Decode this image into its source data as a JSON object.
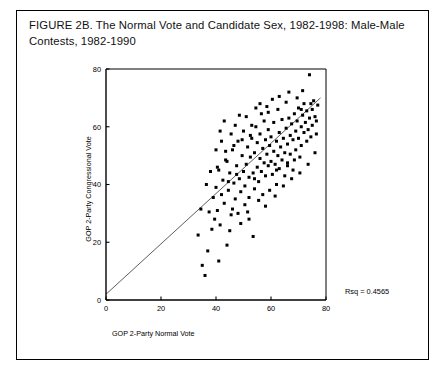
{
  "figure": {
    "title": "FIGURE 2B. The Normal Vote and Candidate Sex, 1982-1998: Male-Male Contests, 1982-1990"
  },
  "annotations": {
    "rsq_label": "Rsq = 0.4565"
  },
  "axis": {
    "x_title": "GOP 2-Party Normal Vote",
    "y_title": "GOP 2-Party Congressional Vote",
    "x_ticks": [
      "0",
      "20",
      "40",
      "60",
      "80"
    ],
    "y_ticks": [
      "0",
      "20",
      "40",
      "60",
      "80"
    ]
  },
  "chart_data": {
    "type": "scatter",
    "title": "FIGURE 2B. The Normal Vote and Candidate Sex, 1982-1998: Male-Male Contests, 1982-1990",
    "xlabel": "GOP 2-Party Normal Vote",
    "ylabel": "GOP 2-Party Congressional Vote",
    "xlim": [
      0,
      80
    ],
    "ylim": [
      0,
      80
    ],
    "xticks": [
      0,
      20,
      40,
      60,
      80
    ],
    "yticks": [
      0,
      20,
      40,
      60,
      80
    ],
    "grid": false,
    "legend": null,
    "marker": "square",
    "marker_color": "#000000",
    "r_squared": 0.4565,
    "annotations": [
      {
        "text": "Rsq = 0.4565",
        "x": 66,
        "y": 7
      }
    ],
    "fit_line": {
      "type": "linear-regression",
      "x0": 0,
      "y0": 2.0,
      "x1": 78,
      "y1": 70.0,
      "color": "#555555"
    },
    "points": [
      [
        33.5,
        22.5
      ],
      [
        35.0,
        12.0
      ],
      [
        36.0,
        8.5
      ],
      [
        37.5,
        30.5
      ],
      [
        38.5,
        24.5
      ],
      [
        39.0,
        35.5
      ],
      [
        40.0,
        39.0
      ],
      [
        40.5,
        31.0
      ],
      [
        41.0,
        45.0
      ],
      [
        41.5,
        26.0
      ],
      [
        42.0,
        36.5
      ],
      [
        42.5,
        41.5
      ],
      [
        43.0,
        33.5
      ],
      [
        43.5,
        48.5
      ],
      [
        44.0,
        19.0
      ],
      [
        44.5,
        38.0
      ],
      [
        45.0,
        44.0
      ],
      [
        45.5,
        29.5
      ],
      [
        46.0,
        52.0
      ],
      [
        46.5,
        40.5
      ],
      [
        47.0,
        35.0
      ],
      [
        47.5,
        46.5
      ],
      [
        48.0,
        55.0
      ],
      [
        48.5,
        42.0
      ],
      [
        49.0,
        37.5
      ],
      [
        49.5,
        50.0
      ],
      [
        50.0,
        44.5
      ],
      [
        50.0,
        58.5
      ],
      [
        50.5,
        39.5
      ],
      [
        51.0,
        47.0
      ],
      [
        51.5,
        53.0
      ],
      [
        52.0,
        42.5
      ],
      [
        52.0,
        35.5
      ],
      [
        52.5,
        49.5
      ],
      [
        53.0,
        56.0
      ],
      [
        53.5,
        44.0
      ],
      [
        54.0,
        51.0
      ],
      [
        54.0,
        38.5
      ],
      [
        54.5,
        60.0
      ],
      [
        55.0,
        46.0
      ],
      [
        55.0,
        54.5
      ],
      [
        55.5,
        41.0
      ],
      [
        56.0,
        49.0
      ],
      [
        56.0,
        57.5
      ],
      [
        56.5,
        44.5
      ],
      [
        57.0,
        52.5
      ],
      [
        57.0,
        36.5
      ],
      [
        57.5,
        47.5
      ],
      [
        58.0,
        55.5
      ],
      [
        58.0,
        43.0
      ],
      [
        58.5,
        50.5
      ],
      [
        59.0,
        59.0
      ],
      [
        59.0,
        46.5
      ],
      [
        59.5,
        53.5
      ],
      [
        60.0,
        48.0
      ],
      [
        60.0,
        56.5
      ],
      [
        60.5,
        43.5
      ],
      [
        61.0,
        51.5
      ],
      [
        61.0,
        61.5
      ],
      [
        61.5,
        47.0
      ],
      [
        62.0,
        55.0
      ],
      [
        62.0,
        40.0
      ],
      [
        62.5,
        50.0
      ],
      [
        63.0,
        58.0
      ],
      [
        63.0,
        45.5
      ],
      [
        63.5,
        53.0
      ],
      [
        64.0,
        48.5
      ],
      [
        64.0,
        62.5
      ],
      [
        64.5,
        56.0
      ],
      [
        65.0,
        51.0
      ],
      [
        65.0,
        43.0
      ],
      [
        65.5,
        59.5
      ],
      [
        66.0,
        54.0
      ],
      [
        66.0,
        47.5
      ],
      [
        66.5,
        63.0
      ],
      [
        67.0,
        57.0
      ],
      [
        67.0,
        50.5
      ],
      [
        67.5,
        61.0
      ],
      [
        68.0,
        55.5
      ],
      [
        68.0,
        45.0
      ],
      [
        68.5,
        64.5
      ],
      [
        69.0,
        58.5
      ],
      [
        69.0,
        52.0
      ],
      [
        69.5,
        62.0
      ],
      [
        70.0,
        56.0
      ],
      [
        70.0,
        66.5
      ],
      [
        70.5,
        49.5
      ],
      [
        71.0,
        60.0
      ],
      [
        71.0,
        53.5
      ],
      [
        71.5,
        64.0
      ],
      [
        72.0,
        58.0
      ],
      [
        72.0,
        68.0
      ],
      [
        72.5,
        61.5
      ],
      [
        73.0,
        55.0
      ],
      [
        73.0,
        65.5
      ],
      [
        73.5,
        59.0
      ],
      [
        74.0,
        63.0
      ],
      [
        74.0,
        78.0
      ],
      [
        74.5,
        56.5
      ],
      [
        75.0,
        66.0
      ],
      [
        75.0,
        60.5
      ],
      [
        75.5,
        69.0
      ],
      [
        76.0,
        63.5
      ],
      [
        76.5,
        57.5
      ],
      [
        77.0,
        67.5
      ],
      [
        52.0,
        28.0
      ],
      [
        53.5,
        22.0
      ],
      [
        49.0,
        26.5
      ],
      [
        44.0,
        48.0
      ],
      [
        45.5,
        57.5
      ],
      [
        38.0,
        44.5
      ],
      [
        40.0,
        52.0
      ],
      [
        41.5,
        58.5
      ],
      [
        43.0,
        62.0
      ],
      [
        47.0,
        60.5
      ],
      [
        48.5,
        64.0
      ],
      [
        51.0,
        63.5
      ],
      [
        54.5,
        66.5
      ],
      [
        56.5,
        64.5
      ],
      [
        58.5,
        67.0
      ],
      [
        36.5,
        40.0
      ],
      [
        39.5,
        28.0
      ],
      [
        42.0,
        55.0
      ],
      [
        46.0,
        31.5
      ],
      [
        50.5,
        33.0
      ],
      [
        55.5,
        34.5
      ],
      [
        59.5,
        38.0
      ],
      [
        61.5,
        36.0
      ],
      [
        64.5,
        39.5
      ],
      [
        67.5,
        42.0
      ],
      [
        70.5,
        44.0
      ],
      [
        73.5,
        47.0
      ],
      [
        76.0,
        51.0
      ],
      [
        62.5,
        66.0
      ],
      [
        65.5,
        68.5
      ],
      [
        69.5,
        70.0
      ],
      [
        71.5,
        72.5
      ],
      [
        59.0,
        65.0
      ],
      [
        53.0,
        60.5
      ],
      [
        57.5,
        62.0
      ],
      [
        44.5,
        41.0
      ],
      [
        37.0,
        17.0
      ],
      [
        41.0,
        13.5
      ],
      [
        34.5,
        31.5
      ],
      [
        63.0,
        70.5
      ],
      [
        66.5,
        72.0
      ],
      [
        74.5,
        68.0
      ],
      [
        76.5,
        62.0
      ],
      [
        60.5,
        69.5
      ],
      [
        56.0,
        68.0
      ],
      [
        49.5,
        55.5
      ],
      [
        52.5,
        57.0
      ],
      [
        46.5,
        53.5
      ],
      [
        43.5,
        51.5
      ],
      [
        40.5,
        46.0
      ],
      [
        48.0,
        30.0
      ],
      [
        51.5,
        30.5
      ],
      [
        45.0,
        24.0
      ],
      [
        58.0,
        32.5
      ],
      [
        66.0,
        46.5
      ],
      [
        71.0,
        66.0
      ],
      [
        68.5,
        48.5
      ],
      [
        62.0,
        45.0
      ],
      [
        54.0,
        42.0
      ],
      [
        47.5,
        43.5
      ]
    ]
  }
}
